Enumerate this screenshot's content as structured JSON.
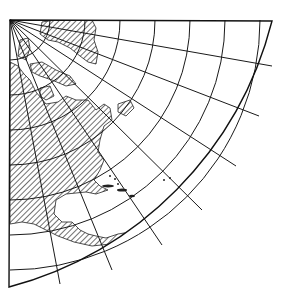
{
  "map": {
    "title": "",
    "subject": "North America map projection with graticule",
    "style": {
      "land_fill": "hatched",
      "hatch_color": "#333333",
      "line_color": "#1a1a1a",
      "background": "#ffffff"
    },
    "graticule": {
      "center": [
        10,
        20
      ],
      "arc_radii": [
        40,
        75,
        110,
        145,
        180,
        215,
        250,
        288,
        330,
        370
      ],
      "radial_angles_deg": [
        0,
        10,
        20,
        30,
        40,
        50,
        60,
        70,
        80,
        90
      ],
      "outer_radius": 375
    },
    "regions": [
      "Greenland",
      "Canadian Arctic Archipelago",
      "Canada",
      "United States",
      "Mexico",
      "Caribbean",
      "Central America",
      "South America (north)"
    ]
  }
}
